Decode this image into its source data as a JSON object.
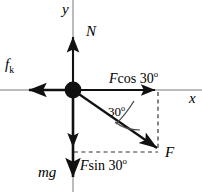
{
  "figure": {
    "kind": "free-body-force-diagram",
    "background_color": "#ffffff",
    "stroke_color": "#000000",
    "axis_color": "#999999",
    "width": 202,
    "height": 192
  },
  "axes": {
    "y_label": "y",
    "x_label": "x",
    "origin": {
      "x": 73,
      "y": 90
    }
  },
  "particle": {
    "name": "point-mass",
    "cx": 73,
    "cy": 90,
    "r": 8
  },
  "vectors": [
    {
      "id": "normal-force",
      "label": "N",
      "direction": "up",
      "from": {
        "x": 73,
        "y": 90
      },
      "to": {
        "x": 73,
        "y": 35
      }
    },
    {
      "id": "kinetic-friction",
      "label_main": "f",
      "label_sub": "k",
      "direction": "left",
      "from": {
        "x": 73,
        "y": 90
      },
      "to": {
        "x": 27,
        "y": 90
      }
    },
    {
      "id": "weight",
      "label": "mg",
      "direction": "down",
      "from": {
        "x": 73,
        "y": 90
      },
      "to": {
        "x": 73,
        "y": 180
      }
    },
    {
      "id": "applied-force",
      "label": "F",
      "direction": "down-right",
      "from": {
        "x": 73,
        "y": 90
      },
      "to": {
        "x": 160,
        "y": 150
      }
    },
    {
      "id": "force-x-component",
      "label_main": "F",
      "label_rest": "cos 30",
      "label_sup": "o",
      "direction": "right",
      "from": {
        "x": 73,
        "y": 90
      },
      "to": {
        "x": 158,
        "y": 90
      }
    },
    {
      "id": "force-y-component",
      "label_main": "F",
      "label_rest": "sin 30",
      "label_sup": "o",
      "direction": "down",
      "from": {
        "x": 73,
        "y": 90
      },
      "to": {
        "x": 73,
        "y": 150
      }
    }
  ],
  "angle": {
    "id": "angle-annotation",
    "value": "30",
    "superscript": "o",
    "between": [
      "applied-force",
      "positive-x-axis"
    ]
  },
  "dashed_guides": [
    {
      "id": "vertical-guide",
      "from": {
        "x": 158,
        "y": 92
      },
      "to": {
        "x": 158,
        "y": 150
      }
    },
    {
      "id": "horizontal-guide",
      "from": {
        "x": 75,
        "y": 152
      },
      "to": {
        "x": 158,
        "y": 152
      }
    }
  ]
}
